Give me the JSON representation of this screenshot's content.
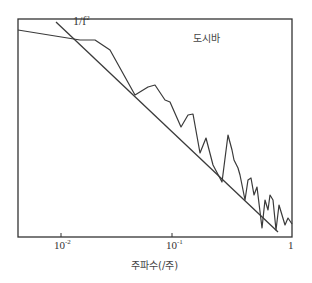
{
  "chart_data": {
    "type": "line",
    "title": "도시바",
    "xlabel": "주파수(/주)",
    "ylabel": "",
    "xscale": "log",
    "yscale": "log",
    "xlim": [
      0.003,
      1
    ],
    "x_ticks": [
      "10^-2",
      "10^-1",
      "1"
    ],
    "annotations": [
      {
        "text": "1/f²",
        "position": "upper-left, near reference line"
      }
    ],
    "grid": false,
    "legend": null,
    "series": [
      {
        "name": "spectrum",
        "style": "jagged line",
        "points_px": [
          [
            18,
            30
          ],
          [
            80,
            40
          ],
          [
            95,
            40
          ],
          [
            110,
            50
          ],
          [
            135,
            95
          ],
          [
            148,
            87
          ],
          [
            155,
            85
          ],
          [
            165,
            100
          ],
          [
            170,
            102
          ],
          [
            181,
            127
          ],
          [
            188,
            115
          ],
          [
            193,
            114
          ],
          [
            200,
            153
          ],
          [
            206,
            138
          ],
          [
            213,
            165
          ],
          [
            222,
            182
          ],
          [
            228,
            135
          ],
          [
            232,
            150
          ],
          [
            234,
            160
          ],
          [
            238,
            168
          ],
          [
            240,
            175
          ],
          [
            245,
            200
          ],
          [
            248,
            180
          ],
          [
            251,
            178
          ],
          [
            254,
            195
          ],
          [
            257,
            187
          ],
          [
            262,
            228
          ],
          [
            265,
            200
          ],
          [
            268,
            210
          ],
          [
            270,
            195
          ],
          [
            273,
            200
          ],
          [
            276,
            230
          ],
          [
            279,
            205
          ],
          [
            282,
            215
          ],
          [
            285,
            225
          ],
          [
            288,
            218
          ],
          [
            292,
            224
          ]
        ]
      },
      {
        "name": "1/f² reference",
        "style": "straight line",
        "points_px": [
          [
            56,
            22
          ],
          [
            278,
            232
          ]
        ]
      }
    ]
  },
  "labels": {
    "title": "도시바",
    "annotation_base": "1/f",
    "annotation_exp": "2",
    "xlabel": "주파수(/주)",
    "tick1_base": "10",
    "tick1_exp": "-2",
    "tick2_base": "10",
    "tick2_exp": "-1",
    "tick3": "1"
  }
}
